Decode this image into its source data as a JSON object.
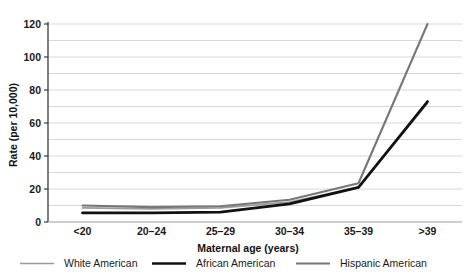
{
  "chart_data": {
    "type": "line",
    "title": "",
    "xlabel": "Maternal age (years)",
    "ylabel": "Rate (per 10,000)",
    "categories": [
      "<20",
      "20–24",
      "25–29",
      "30–34",
      "35–39",
      ">39"
    ],
    "ylim": [
      0,
      120
    ],
    "ytick_labels": [
      "0",
      "20",
      "40",
      "60",
      "80",
      "100",
      "120"
    ],
    "ytick_values": [
      0,
      20,
      40,
      60,
      80,
      100,
      120
    ],
    "minor_gridline_values": [
      10,
      30,
      50,
      70,
      90,
      110
    ],
    "grid": true,
    "legend_position": "bottom",
    "series": [
      {
        "name": "White American",
        "color": "#9a9a9a",
        "values": [
          8.5,
          8.0,
          8.5,
          12.0,
          21.0,
          72.0
        ]
      },
      {
        "name": "African American",
        "color": "#111111",
        "values": [
          5.5,
          5.5,
          6.0,
          11.0,
          21.0,
          73.0
        ]
      },
      {
        "name": "Hispanic American",
        "color": "#777777",
        "values": [
          10.0,
          9.0,
          9.5,
          13.5,
          23.5,
          120.0
        ]
      }
    ]
  },
  "axes": {
    "y_axis_label": "Rate (per 10,000)",
    "x_axis_label": "Maternal age (years)"
  },
  "legend": {
    "items": [
      {
        "label": "White American",
        "color": "#9a9a9a",
        "width": 1.6
      },
      {
        "label": "African American",
        "color": "#111111",
        "width": 2.6
      },
      {
        "label": "Hispanic American",
        "color": "#777777",
        "width": 2.0
      }
    ]
  },
  "colors": {
    "grid": "#d8d8d8",
    "axis": "#555555",
    "background": "#ffffff",
    "text": "#1a1a1a"
  }
}
